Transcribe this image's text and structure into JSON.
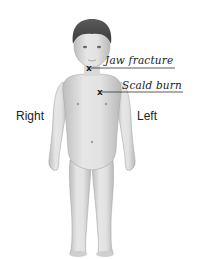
{
  "diagram": {
    "type": "body-chart",
    "orientation_labels": {
      "right": "Right",
      "left": "Left"
    },
    "annotations": [
      {
        "label": "Jaw fracture",
        "marker": "x",
        "location": "jaw"
      },
      {
        "label": "Scald burn",
        "marker": "x",
        "location": "left upper chest"
      }
    ],
    "colors": {
      "skin": "#dcdcdc",
      "skin_shadow": "#b8b8b8",
      "hair": "#4a4a4a",
      "text": "#222222",
      "background": "#ffffff"
    }
  }
}
